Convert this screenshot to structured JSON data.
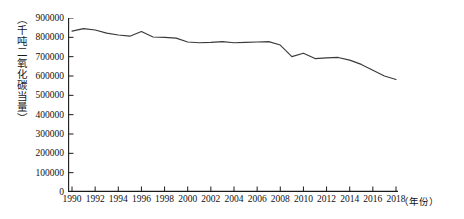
{
  "chart_data": {
    "type": "line",
    "title": "",
    "xlabel": "（年份）",
    "ylabel": "（千吨二氧化碳当量）",
    "xlim": [
      1990,
      2018
    ],
    "ylim": [
      0,
      900000
    ],
    "grid": false,
    "legend": null,
    "y_ticks": [
      0,
      100000,
      200000,
      300000,
      400000,
      500000,
      600000,
      700000,
      800000,
      900000
    ],
    "y_tick_labels": [
      "0",
      "100000",
      "200000",
      "300000",
      "400000",
      "500000",
      "600000",
      "700000",
      "800000",
      "900000"
    ],
    "x_ticks": [
      1990,
      1992,
      1994,
      1996,
      1998,
      2000,
      2002,
      2004,
      2006,
      2008,
      2010,
      2012,
      2014,
      2016,
      2018
    ],
    "x_tick_labels": [
      "1990",
      "1992",
      "1994",
      "1996",
      "1998",
      "2000",
      "2002",
      "2004",
      "2006",
      "2008",
      "2010",
      "2012",
      "2014",
      "2016",
      "2018"
    ],
    "series": [
      {
        "name": "温室气体排放量",
        "color": "#3a3a3a",
        "x": [
          1990,
          1991,
          1992,
          1993,
          1994,
          1995,
          1996,
          1997,
          1998,
          1999,
          2000,
          2001,
          2002,
          2003,
          2004,
          2005,
          2006,
          2007,
          2008,
          2009,
          2010,
          2011,
          2012,
          2013,
          2014,
          2015,
          2016,
          2017,
          2018
        ],
        "values": [
          832000,
          845000,
          838000,
          822000,
          812000,
          806000,
          830000,
          802000,
          800000,
          796000,
          776000,
          772000,
          774000,
          778000,
          772000,
          774000,
          776000,
          778000,
          760000,
          700000,
          718000,
          690000,
          694000,
          696000,
          682000,
          660000,
          630000,
          600000,
          582000
        ]
      }
    ]
  }
}
